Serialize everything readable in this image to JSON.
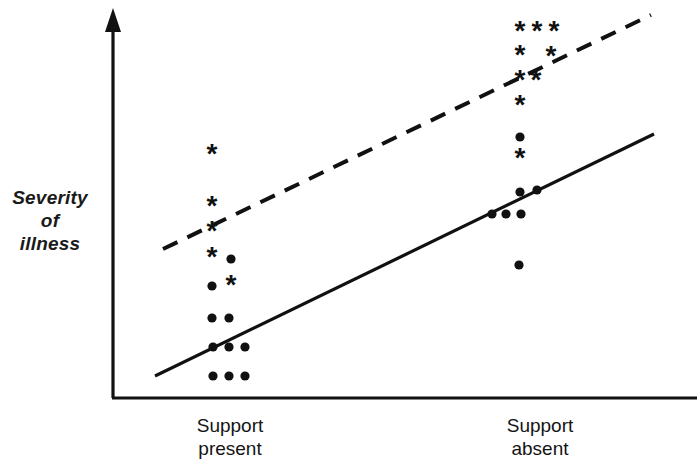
{
  "figure": {
    "background_color": "#ffffff",
    "ink_color": "#111111"
  },
  "axes": {
    "y_label_lines": [
      "Severity",
      "of",
      "illness"
    ],
    "y_axis": {
      "x": 113,
      "y_top": 8,
      "y_bottom": 398,
      "arrow": true
    },
    "x_axis": {
      "y": 398,
      "x_left": 113,
      "x_right": 697,
      "arrow": false
    },
    "x_tick_labels": [
      {
        "id": "support-present",
        "lines": [
          "Support",
          "present"
        ],
        "center_x": 230
      },
      {
        "id": "support-absent",
        "lines": [
          "Support",
          "absent"
        ],
        "center_x": 540
      }
    ]
  },
  "chart_data": {
    "type": "scatter",
    "title": "",
    "xlabel": "",
    "ylabel": "Severity of illness",
    "categories": [
      "Support present",
      "Support absent"
    ],
    "grid": false,
    "legend": null,
    "axis_ranges": {
      "x": [
        113,
        697
      ],
      "y": [
        8,
        398
      ]
    },
    "note": "Pixel coordinates are used directly as data coordinates; y increases downward on screen so smaller y = greater severity of illness.",
    "series": [
      {
        "name": "High-risk group",
        "marker": "asterisk",
        "marker_glyph": "*",
        "color": "#111111",
        "trend_line": {
          "style": "dashed",
          "x1": 163,
          "y1": 249,
          "x2": 651,
          "y2": 15,
          "dash_pattern": "16 11"
        },
        "points": [
          {
            "x": 212,
            "y": 155,
            "category": "Support present"
          },
          {
            "x": 212,
            "y": 207,
            "category": "Support present"
          },
          {
            "x": 212,
            "y": 232,
            "category": "Support present"
          },
          {
            "x": 212,
            "y": 258,
            "category": "Support present"
          },
          {
            "x": 231,
            "y": 286,
            "category": "Support present"
          },
          {
            "x": 520,
            "y": 32,
            "category": "Support absent"
          },
          {
            "x": 537,
            "y": 32,
            "category": "Support absent"
          },
          {
            "x": 554,
            "y": 32,
            "category": "Support absent"
          },
          {
            "x": 520,
            "y": 56,
            "category": "Support absent"
          },
          {
            "x": 551,
            "y": 57,
            "category": "Support absent"
          },
          {
            "x": 520,
            "y": 81,
            "category": "Support absent"
          },
          {
            "x": 536,
            "y": 81,
            "category": "Support absent"
          },
          {
            "x": 520,
            "y": 106,
            "category": "Support absent"
          },
          {
            "x": 520,
            "y": 159,
            "category": "Support absent"
          }
        ]
      },
      {
        "name": "Low-risk group",
        "marker": "dot",
        "marker_glyph": "•",
        "color": "#111111",
        "trend_line": {
          "style": "solid",
          "x1": 155,
          "y1": 376,
          "x2": 654,
          "y2": 134,
          "dash_pattern": null
        },
        "points": [
          {
            "x": 231,
            "y": 259,
            "category": "Support present"
          },
          {
            "x": 212,
            "y": 286,
            "category": "Support present"
          },
          {
            "x": 212,
            "y": 318,
            "category": "Support present"
          },
          {
            "x": 229,
            "y": 318,
            "category": "Support present"
          },
          {
            "x": 213,
            "y": 347,
            "category": "Support present"
          },
          {
            "x": 229,
            "y": 347,
            "category": "Support present"
          },
          {
            "x": 245,
            "y": 347,
            "category": "Support present"
          },
          {
            "x": 213,
            "y": 376,
            "category": "Support present"
          },
          {
            "x": 229,
            "y": 376,
            "category": "Support present"
          },
          {
            "x": 245,
            "y": 376,
            "category": "Support present"
          },
          {
            "x": 520,
            "y": 137,
            "category": "Support absent"
          },
          {
            "x": 520,
            "y": 192,
            "category": "Support absent"
          },
          {
            "x": 537,
            "y": 190,
            "category": "Support absent"
          },
          {
            "x": 492,
            "y": 214,
            "category": "Support absent"
          },
          {
            "x": 506,
            "y": 214,
            "category": "Support absent"
          },
          {
            "x": 521,
            "y": 214,
            "category": "Support absent"
          },
          {
            "x": 519,
            "y": 265,
            "category": "Support absent"
          }
        ]
      }
    ]
  }
}
